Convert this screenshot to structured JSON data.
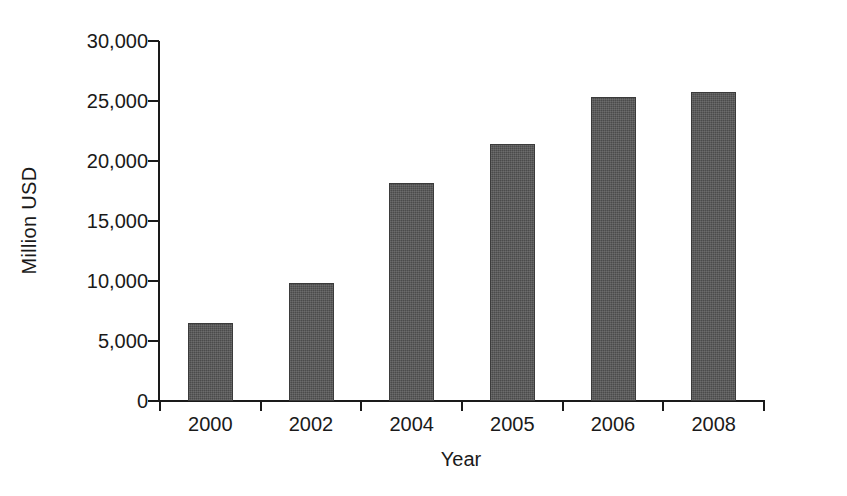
{
  "chart_data": {
    "type": "bar",
    "title": "",
    "subtitle": "",
    "xlabel": "Year",
    "ylabel": "Million USD",
    "categories": [
      "2000",
      "2002",
      "2004",
      "2005",
      "2006",
      "2008"
    ],
    "values": [
      6500,
      9800,
      18150,
      21450,
      25300,
      25750
    ],
    "ylim": [
      0,
      30000
    ],
    "ytick_values": [
      0,
      5000,
      10000,
      15000,
      20000,
      25000,
      30000
    ],
    "ytick_labels": [
      "0",
      "5,000",
      "10,000",
      "15,000",
      "20,000",
      "25,000",
      "30,000"
    ],
    "grid": false,
    "legend": null,
    "legend_position": "none",
    "series": [
      {
        "name": "Million USD",
        "values": [
          6500,
          9800,
          18150,
          21450,
          25300,
          25750
        ]
      }
    ],
    "bar_color": "#4b4b4b",
    "axis_color": "#1a1a1a",
    "background_color": "#ffffff"
  }
}
